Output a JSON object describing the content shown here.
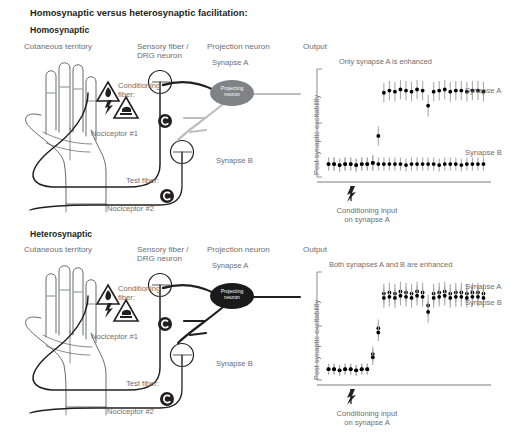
{
  "title": "Homosynaptic versus heterosynaptic facilitation:",
  "sections": [
    {
      "name": "Homosynaptic",
      "heading": "Homosynaptic",
      "columns": {
        "cutaneous": "Cutaneous territory",
        "sensory": "Sensory fiber /\nDRG neuron",
        "projection": "Projection neuron",
        "output": "Output"
      },
      "labels": {
        "conditioning_fiber": "Conditioning\nfiber:",
        "nociceptor1": "Nociceptor #1",
        "test_fiber": "Test fiber:",
        "nociceptor2": "Nociceptor #2",
        "synapse_a": "Synapse A",
        "synapse_b": "Synapse B",
        "projecting_neuron": "Projecting\nneuron"
      }
    },
    {
      "name": "Heterosynaptic",
      "heading": "Heterosynaptic",
      "columns": {
        "cutaneous": "Cutaneous territory",
        "sensory": "Sensory fiber /\nDRG neuron",
        "projection": "Projection neuron",
        "output": "Output"
      },
      "labels": {
        "conditioning_fiber": "Conditioning\nfiber:",
        "nociceptor1": "Nociceptor #1",
        "test_fiber": "Test fiber:",
        "nociceptor2": "Nociceptor #2",
        "synapse_a": "Synapse A",
        "synapse_b": "Synapse B",
        "projecting_neuron": "Projecting\nneuron"
      }
    }
  ],
  "chart_data": [
    {
      "id": "homosynaptic-chart",
      "type": "scatter",
      "title": "Only synapse A is enhanced",
      "xlabel": "Conditioning input\non synapse A",
      "ylabel": "Post synaptic excitability",
      "ylim": [
        0,
        100
      ],
      "xlim": [
        0,
        30
      ],
      "grid": false,
      "legend_position": "right",
      "annotation": "Conditioning input\non synapse A",
      "conditioning_event_x": 9,
      "series": [
        {
          "name": "Synapse A",
          "color": "#000000",
          "x": [
            1,
            2,
            3,
            4,
            5,
            6,
            7,
            8,
            9,
            10,
            11,
            12,
            13,
            14,
            15,
            16,
            17,
            18,
            19,
            20,
            21,
            22,
            23,
            24,
            25,
            26,
            27,
            28,
            29
          ],
          "values": [
            12,
            12,
            11,
            12,
            12,
            11,
            12,
            12,
            13,
            38,
            78,
            80,
            79,
            81,
            80,
            79,
            81,
            80,
            66,
            79,
            80,
            81,
            79,
            80,
            80,
            79,
            80,
            80,
            79
          ],
          "errors": [
            6,
            6,
            6,
            6,
            6,
            6,
            6,
            6,
            7,
            9,
            9,
            9,
            9,
            9,
            9,
            9,
            9,
            9,
            10,
            9,
            9,
            9,
            9,
            9,
            9,
            9,
            9,
            9,
            9
          ]
        },
        {
          "name": "Synapse B",
          "color": "#000000",
          "x": [
            1,
            2,
            3,
            4,
            5,
            6,
            7,
            8,
            9,
            10,
            11,
            12,
            13,
            14,
            15,
            16,
            17,
            18,
            19,
            20,
            21,
            22,
            23,
            24,
            25,
            26,
            27,
            28,
            29
          ],
          "values": [
            12,
            12,
            11,
            12,
            12,
            11,
            12,
            12,
            13,
            12,
            12,
            12,
            12,
            12,
            11,
            12,
            12,
            12,
            12,
            12,
            11,
            12,
            12,
            12,
            11,
            12,
            12,
            12,
            12
          ],
          "errors": [
            6,
            6,
            6,
            6,
            6,
            6,
            6,
            6,
            7,
            6,
            6,
            6,
            6,
            6,
            6,
            6,
            6,
            6,
            6,
            6,
            6,
            6,
            6,
            6,
            6,
            6,
            6,
            6,
            6
          ]
        }
      ],
      "legend": [
        "Synapse A",
        "Synapse B"
      ]
    },
    {
      "id": "heterosynaptic-chart",
      "type": "scatter",
      "title": "Both synapses A and B are enhanced",
      "xlabel": "Conditioning input\non synapse A",
      "ylabel": "Post synaptic excitability",
      "ylim": [
        0,
        100
      ],
      "xlim": [
        0,
        30
      ],
      "grid": false,
      "legend_position": "right",
      "annotation": "Conditioning input\non synapse A",
      "conditioning_event_x": 9,
      "series": [
        {
          "name": "Synapse A",
          "color": "#000000",
          "x": [
            1,
            2,
            3,
            4,
            5,
            6,
            7,
            8,
            9,
            10,
            11,
            12,
            13,
            14,
            15,
            16,
            17,
            18,
            19,
            20,
            21,
            22,
            23,
            24,
            25,
            26,
            27,
            28,
            29
          ],
          "values": [
            10,
            10,
            9,
            10,
            10,
            9,
            10,
            10,
            24,
            48,
            80,
            81,
            80,
            82,
            81,
            80,
            82,
            81,
            69,
            80,
            81,
            82,
            80,
            81,
            81,
            80,
            81,
            81,
            80
          ],
          "errors": [
            5,
            5,
            5,
            5,
            5,
            5,
            5,
            5,
            7,
            8,
            9,
            9,
            9,
            9,
            9,
            9,
            9,
            9,
            10,
            9,
            9,
            9,
            9,
            9,
            9,
            9,
            9,
            9,
            9
          ]
        },
        {
          "name": "Synapse B",
          "color": "#000000",
          "x": [
            1,
            2,
            3,
            4,
            5,
            6,
            7,
            8,
            9,
            10,
            11,
            12,
            13,
            14,
            15,
            16,
            17,
            18,
            19,
            20,
            21,
            22,
            23,
            24,
            25,
            26,
            27,
            28,
            29
          ],
          "values": [
            10,
            10,
            9,
            10,
            10,
            9,
            10,
            10,
            21,
            44,
            76,
            77,
            76,
            78,
            77,
            76,
            78,
            77,
            63,
            76,
            77,
            78,
            76,
            77,
            77,
            76,
            77,
            77,
            76
          ],
          "errors": [
            5,
            5,
            5,
            5,
            5,
            5,
            5,
            5,
            7,
            8,
            9,
            9,
            9,
            9,
            9,
            9,
            9,
            9,
            10,
            9,
            9,
            9,
            9,
            9,
            9,
            9,
            9,
            9,
            9
          ]
        }
      ],
      "legend": [
        "Synapse A",
        "Synapse B"
      ]
    }
  ],
  "colors": {
    "text": "#6d6e71",
    "heading": "#231f20",
    "axis": "#939598",
    "marker": "#1a1a1a",
    "errorbar": "#a7a9ac",
    "neuron_inactive": "#808285",
    "neuron_active": "#1a1a1a",
    "outline": "#58595b"
  }
}
